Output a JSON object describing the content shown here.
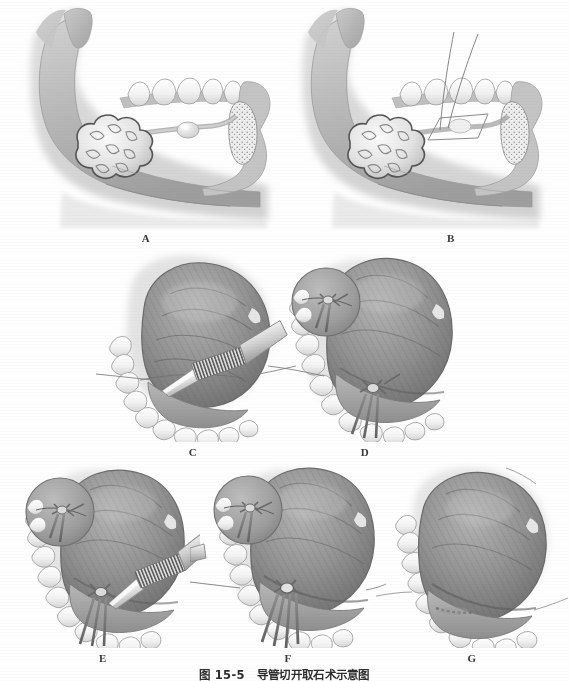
{
  "figure": {
    "caption_number": "图 15-5",
    "caption_title": "导管切开取石术示意图",
    "background_color": "#fefefe",
    "ink_color": "#3a3a3a"
  },
  "panels": [
    {
      "id": "A",
      "label": "A",
      "row": 1,
      "view": "sagittal-mandible",
      "description": "下颌骨矢状观，示下颌下腺、下颌下腺导管内结石及舌下腺",
      "structures": [
        "mandible",
        "teeth",
        "submandibular-gland",
        "submandibular-duct",
        "sialolith",
        "sublingual-gland",
        "floor-of-mouth"
      ]
    },
    {
      "id": "B",
      "label": "B",
      "row": 1,
      "view": "sagittal-mandible",
      "description": "于结石后方经口底穿缝牵引线，阻止结石后移",
      "structures": [
        "mandible",
        "teeth",
        "submandibular-gland",
        "submandibular-duct",
        "sialolith",
        "sublingual-gland",
        "suture-thread",
        "incision-outline"
      ]
    },
    {
      "id": "C",
      "label": "C",
      "row": 2,
      "view": "intraoral",
      "description": "口内观，抬舌显露口底，用尖刀沿导管走行切开黏膜",
      "structures": [
        "tongue",
        "lower-dental-arch",
        "floor-of-mouth",
        "scalpel",
        "suture-thread"
      ]
    },
    {
      "id": "D",
      "label": "D",
      "row": 2,
      "view": "intraoral",
      "description": "缝线牵引固定导管，放大示意图示缝合打结",
      "structures": [
        "tongue",
        "lower-dental-arch",
        "floor-of-mouth",
        "suture-thread",
        "knot",
        "magnified-inset"
      ]
    },
    {
      "id": "E",
      "label": "E",
      "row": 3,
      "view": "intraoral",
      "description": "牵引缝线固定下，用尖刀纵行切开导管壁",
      "structures": [
        "tongue",
        "lower-dental-arch",
        "floor-of-mouth",
        "scalpel",
        "suture-thread",
        "knot",
        "magnified-inset"
      ]
    },
    {
      "id": "F",
      "label": "F",
      "row": 3,
      "view": "intraoral",
      "description": "经导管切口取出结石",
      "structures": [
        "tongue",
        "lower-dental-arch",
        "floor-of-mouth",
        "forceps",
        "suture-thread",
        "knot",
        "magnified-inset"
      ]
    },
    {
      "id": "G",
      "label": "G",
      "row": 3,
      "view": "intraoral",
      "description": "取石后导管切口敞开引流，不予缝合",
      "structures": [
        "tongue",
        "lower-dental-arch",
        "floor-of-mouth",
        "duct-opening"
      ]
    }
  ]
}
